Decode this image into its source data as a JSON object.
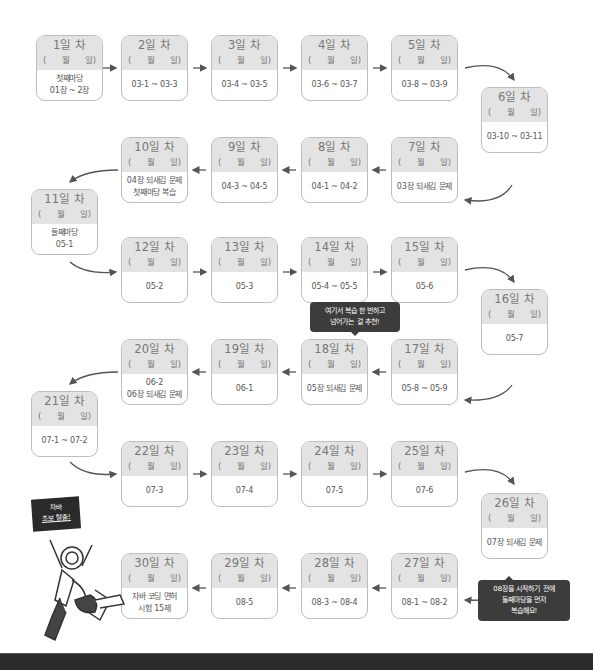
{
  "date_template": {
    "open": "(",
    "month": "월",
    "day": "일)"
  },
  "days": [
    {
      "label": "1일 차",
      "lines": [
        "첫째마당",
        "01장 ~ 2장"
      ]
    },
    {
      "label": "2일 차",
      "lines": [
        "03-1 ~ 03-3"
      ]
    },
    {
      "label": "3일 차",
      "lines": [
        "03-4 ~ 03-5"
      ]
    },
    {
      "label": "4일 차",
      "lines": [
        "03-6 ~ 03-7"
      ]
    },
    {
      "label": "5일 차",
      "lines": [
        "03-8 ~ 03-9"
      ]
    },
    {
      "label": "6일 차",
      "lines": [
        "03-10 ~ 03-11"
      ]
    },
    {
      "label": "7일 차",
      "lines": [
        "03장 되새김 문제"
      ]
    },
    {
      "label": "8일 차",
      "lines": [
        "04-1 ~ 04-2"
      ]
    },
    {
      "label": "9일 차",
      "lines": [
        "04-3 ~ 04-5"
      ]
    },
    {
      "label": "10일 차",
      "lines": [
        "04장 되새김 문제",
        "첫째마당 복습"
      ]
    },
    {
      "label": "11일 차",
      "lines": [
        "둘째마당",
        "05-1"
      ]
    },
    {
      "label": "12일 차",
      "lines": [
        "05-2"
      ]
    },
    {
      "label": "13일 차",
      "lines": [
        "05-3"
      ]
    },
    {
      "label": "14일 차",
      "lines": [
        "05-4 ~ 05-5"
      ]
    },
    {
      "label": "15일 차",
      "lines": [
        "05-6"
      ]
    },
    {
      "label": "16일 차",
      "lines": [
        "05-7"
      ]
    },
    {
      "label": "17일 차",
      "lines": [
        "05-8 ~ 05-9"
      ]
    },
    {
      "label": "18일 차",
      "lines": [
        "05장 되새김 문제"
      ]
    },
    {
      "label": "19일 차",
      "lines": [
        "06-1"
      ]
    },
    {
      "label": "20일 차",
      "lines": [
        "06-2",
        "06장 되새김 문제"
      ]
    },
    {
      "label": "21일 차",
      "lines": [
        "07-1 ~ 07-2"
      ]
    },
    {
      "label": "22일 차",
      "lines": [
        "07-3"
      ]
    },
    {
      "label": "23일 차",
      "lines": [
        "07-4"
      ]
    },
    {
      "label": "24일 차",
      "lines": [
        "07-5"
      ]
    },
    {
      "label": "25일 차",
      "lines": [
        "07-6"
      ]
    },
    {
      "label": "26일 차",
      "lines": [
        "07장 되새김 문제"
      ]
    },
    {
      "label": "27일 차",
      "lines": [
        "08-1 ~ 08-2"
      ]
    },
    {
      "label": "28일 차",
      "lines": [
        "08-3 ~ 08-4"
      ]
    },
    {
      "label": "29일 차",
      "lines": [
        "08-5"
      ]
    },
    {
      "label": "30일 차",
      "lines": [
        "자바 코딩 면허",
        "시험 15제"
      ]
    }
  ],
  "callouts": {
    "review_tip": [
      "여기서 복습 한 번하고",
      "넘어가는 걸 추천!"
    ],
    "before_ch8": [
      "08장을 시작하기 전에",
      "둘째마당을 먼저",
      "복습해요!"
    ],
    "mascot_sign": [
      "자바",
      "초보 탈출!"
    ]
  },
  "colors": {
    "card_header": "#e3e3e3",
    "card_border": "#bdbdbd",
    "callout_bg": "#3c3c3c",
    "arrow": "#555555"
  }
}
